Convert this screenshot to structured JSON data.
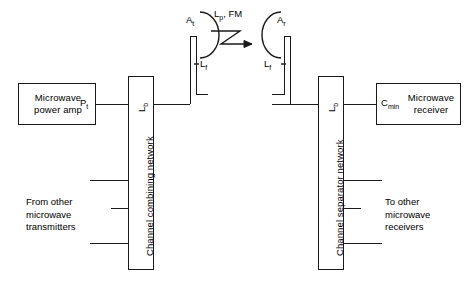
{
  "diagram": {
    "stroke_color": "#1a1a1a",
    "background": "#ffffff"
  },
  "transmit": {
    "power_amp_label": "Microwave\npower amp",
    "transmit_power_symbol": "P",
    "transmit_power_subscript": "t",
    "combining_network_label": "Channel combining network",
    "branching_loss_symbol": "L",
    "branching_loss_subscript": "b",
    "feeder_loss_symbol": "L",
    "feeder_loss_subscript": "f",
    "antenna_symbol": "A",
    "antenna_subscript": "t",
    "other_sources_label": "From other\nmicrowave\ntransmitters"
  },
  "path": {
    "path_loss_label": "L",
    "path_loss_subscript": "p",
    "fade_margin_label": ", FM"
  },
  "receive": {
    "antenna_symbol": "A",
    "antenna_subscript": "r",
    "feeder_loss_symbol": "L",
    "feeder_loss_subscript": "f",
    "separator_network_label": "Channel separator network",
    "branching_loss_symbol": "L",
    "branching_loss_subscript": "b",
    "min_carrier_symbol": "C",
    "min_carrier_subscript": "min",
    "receiver_label": "Microwave\nreceiver",
    "other_sinks_label": "To other\nmicrowave\nreceivers"
  }
}
